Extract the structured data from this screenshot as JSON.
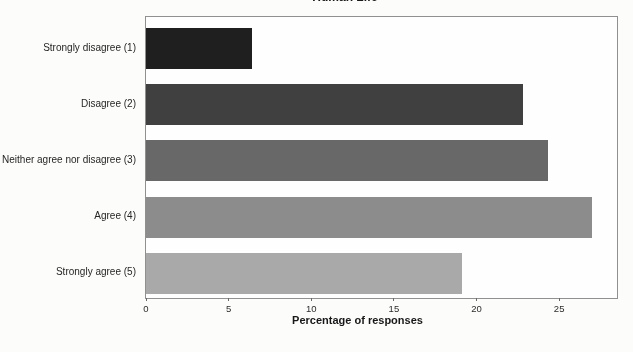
{
  "figure": {
    "title": "Human Life",
    "xlabel": "Percentage of responses"
  },
  "chart_data": {
    "type": "bar",
    "orientation": "horizontal",
    "title": "Human Life",
    "categories": [
      "Strongly disagree (1)",
      "Disagree (2)",
      "Neither agree nor disagree (3)",
      "Agree (4)",
      "Strongly agree (5)"
    ],
    "values": [
      6.4,
      22.8,
      24.3,
      27.0,
      19.1
    ],
    "xlabel": "Percentage of responses",
    "xticks": [
      0,
      5,
      10,
      15,
      20,
      25
    ],
    "xlim": [
      0,
      28.5
    ],
    "bar_colors": [
      "#1f1f1f",
      "#404040",
      "#686868",
      "#8c8c8c",
      "#a9a9a9"
    ],
    "grid": false,
    "legend": "none",
    "frame_color": "#909090",
    "plot_background": "#fefefe"
  }
}
